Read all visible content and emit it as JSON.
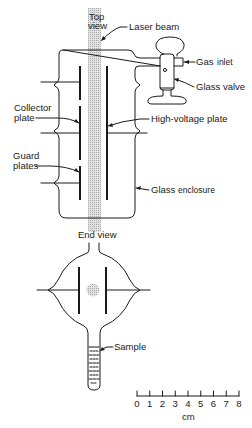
{
  "figure": {
    "top_view": {
      "view_label_line1": "Top",
      "view_label_line2": "view",
      "labels": {
        "laser_beam": "Laser beam",
        "gas": "Gas",
        "inlet": "inlet",
        "glass_valve": "Glass valve",
        "collector_line1": "Collector",
        "collector_line2": "plate",
        "high_voltage_plate": "High-voltage plate",
        "guard_line1": "Guard",
        "guard_line2": "plates",
        "glass": "Glass",
        "enclosure": "enclosure"
      }
    },
    "end_view": {
      "view_label": "End view",
      "labels": {
        "sample": "Sample"
      }
    },
    "scale_bar": {
      "ticks": [
        "0",
        "1",
        "2",
        "3",
        "4",
        "5",
        "6",
        "7",
        "8"
      ],
      "unit": "cm",
      "min": 0,
      "max": 8
    },
    "colors": {
      "ink": "#1a1a1a",
      "beam": "#c8c8c8"
    }
  }
}
